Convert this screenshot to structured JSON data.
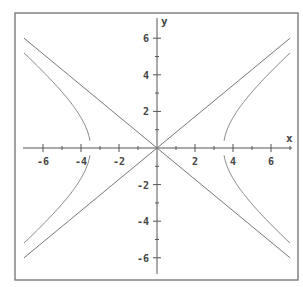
{
  "chart_data": {
    "type": "line",
    "title": "",
    "xlabel": "x",
    "ylabel": "y",
    "xlim": [
      -7,
      7
    ],
    "ylim": [
      -7,
      7
    ],
    "grid": false,
    "legend": null,
    "x_ticks": [
      -6,
      -4,
      -2,
      2,
      4,
      6
    ],
    "y_ticks": [
      6,
      4,
      2,
      -2,
      -4,
      -6
    ],
    "x_tick_labels": [
      "-6",
      "-4",
      "-2",
      "2",
      "4",
      "6"
    ],
    "y_tick_labels": [
      "6",
      "4",
      "2",
      "-2",
      "-4",
      "-6"
    ],
    "minor_tick_step": 1,
    "series": [
      {
        "name": "asymptote y = (6/7)x",
        "kind": "line",
        "x": [
          -7,
          7
        ],
        "y": [
          -6,
          6
        ]
      },
      {
        "name": "asymptote y = -(6/7)x",
        "kind": "line",
        "x": [
          -7,
          7
        ],
        "y": [
          6,
          -6
        ]
      },
      {
        "name": "hyperbola x^2/12.25 - y^2/9 = 1",
        "kind": "hyperbola",
        "a": 3.5,
        "b": 3,
        "x_range": [
          -7,
          7
        ],
        "vertex_gap_y": 0.4,
        "points_right_upper": [
          [
            3.55,
            0.5
          ],
          [
            4,
            1.45
          ],
          [
            5,
            2.14
          ],
          [
            6,
            2.92
          ],
          [
            7,
            5.2
          ]
        ],
        "points_left_upper": [
          [
            -3.55,
            0.5
          ],
          [
            -4,
            1.45
          ],
          [
            -5,
            2.14
          ],
          [
            -6,
            2.92
          ],
          [
            -7,
            5.2
          ]
        ]
      }
    ]
  },
  "plot": {
    "frame": {
      "x": 15,
      "y": 13,
      "w": 283,
      "h": 267
    },
    "origin_px": [
      157,
      148
    ],
    "px_per_unit_x": 19,
    "px_per_unit_y": 18.3,
    "x_axis_px": [
      23,
      292
    ],
    "y_axis_px": [
      18,
      274
    ],
    "colors": {
      "frame": "#7a7a7a",
      "axis": "#555555",
      "asymptote": "#777777",
      "hyperbola": "#888888",
      "text": "#444444"
    }
  }
}
